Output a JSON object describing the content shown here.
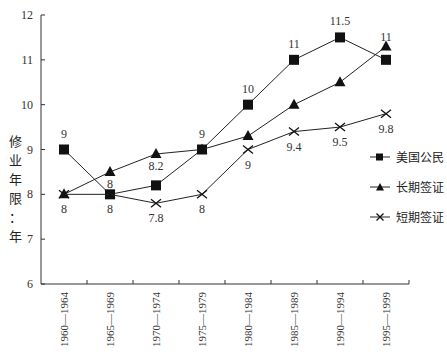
{
  "chart_data": {
    "type": "line",
    "title": "",
    "xlabel": "",
    "ylabel": "修业年限：年",
    "ylim": [
      6,
      12
    ],
    "yticks": [
      6,
      7,
      8,
      9,
      10,
      11,
      12
    ],
    "grid": false,
    "legend_position": "right",
    "categories": [
      "1960—1964",
      "1965—1969",
      "1970—1974",
      "1975—1979",
      "1980—1984",
      "1985—1989",
      "1990—1994",
      "1995—1999"
    ],
    "series": [
      {
        "name": "美国公民",
        "marker": "square",
        "values": [
          9,
          8,
          8.2,
          9,
          10,
          11,
          11.5,
          11
        ],
        "labels": [
          "9",
          "",
          "",
          "9",
          "10",
          "11",
          "11.5",
          ""
        ]
      },
      {
        "name": "长期签证",
        "marker": "triangle",
        "values": [
          8,
          8.5,
          8.9,
          9,
          9.3,
          10,
          10.5,
          11.3
        ],
        "labels": [
          "",
          "8",
          "8.2",
          "",
          "",
          "",
          "",
          "11"
        ]
      },
      {
        "name": "短期签证",
        "marker": "x",
        "values": [
          8,
          8,
          7.8,
          8,
          9,
          9.4,
          9.5,
          9.8
        ],
        "labels": [
          "8",
          "8",
          "7.8",
          "8",
          "9",
          "9.4",
          "9.5",
          "9.8"
        ]
      }
    ]
  },
  "axis": {
    "ylabel_chars": [
      "修",
      "业",
      "年",
      "限",
      "：",
      "年"
    ]
  },
  "legend": {
    "items": [
      {
        "label": "美国公民"
      },
      {
        "label": "长期签证"
      },
      {
        "label": "短期签证"
      }
    ]
  }
}
